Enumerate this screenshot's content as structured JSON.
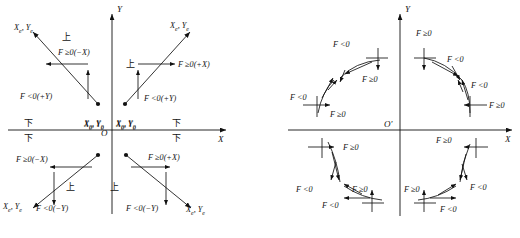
{
  "figure": {
    "caption": "",
    "axis_x": "X",
    "axis_y": "Y"
  },
  "left_diagram": {
    "name": "straight-line-interpolation-octants",
    "origin": "O",
    "axis_x": "X",
    "axis_y": "Y",
    "start_point": "X0, Y0",
    "end_point": "Xe, Ye",
    "marker_up": "上",
    "marker_down": "下",
    "quadrants": [
      {
        "id": "upper-left",
        "end_label": "Xe, Ye",
        "start_label": "X0, Y0",
        "x_label": "F ≥0(−X)",
        "y_label": "F <0(+Y)",
        "marker": "上"
      },
      {
        "id": "upper-right",
        "end_label": "Xe, Ye",
        "start_label": "X0, Y0",
        "x_label": "F ≥0(+X)",
        "y_label": "F <0(+Y)",
        "marker": "上"
      },
      {
        "id": "lower-left",
        "end_label": "Xe, Ye",
        "start_label": "X0, Y0",
        "x_label": "F ≥0(−X)",
        "y_label": "F <0(−Y)",
        "marker": "上"
      },
      {
        "id": "lower-right",
        "end_label": "Xe, Ye",
        "start_label": "X0, Y0",
        "x_label": "F ≥0(+X)",
        "y_label": "F <0(−Y)",
        "marker": "上"
      }
    ],
    "axis_markers": [
      {
        "id": "left-above",
        "text": "下"
      },
      {
        "id": "left-below",
        "text": "下"
      },
      {
        "id": "right-above",
        "text": "下"
      },
      {
        "id": "right-below",
        "text": "下"
      }
    ]
  },
  "right_diagram": {
    "name": "circular-interpolation-octants",
    "origin": "O'",
    "axis_x": "X",
    "axis_y": "Y",
    "arc_labels": [
      {
        "id": "ul-outer",
        "text": "F <0"
      },
      {
        "id": "ul-outer-2",
        "text": "F ≥0"
      },
      {
        "id": "ul-inner",
        "text": "F <0"
      },
      {
        "id": "ul-inner-2",
        "text": "F ≥0"
      },
      {
        "id": "ur-outer",
        "text": "F ≥0"
      },
      {
        "id": "ur-outer-2",
        "text": "F <0"
      },
      {
        "id": "ur-inner",
        "text": "F <0"
      },
      {
        "id": "ur-inner-2",
        "text": "F ≥0"
      },
      {
        "id": "ll-outer",
        "text": "F ≥0"
      },
      {
        "id": "ll-outer-2",
        "text": "F <0"
      },
      {
        "id": "ll-inner",
        "text": "F ≥0"
      },
      {
        "id": "ll-inner-2",
        "text": "F <0"
      },
      {
        "id": "lr-outer",
        "text": "F ≥0"
      },
      {
        "id": "lr-outer-2",
        "text": "F <0"
      },
      {
        "id": "lr-inner",
        "text": "F ≥0"
      },
      {
        "id": "lr-inner-2",
        "text": "F <0"
      }
    ]
  }
}
